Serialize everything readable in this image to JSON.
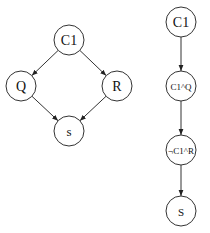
{
  "diagrams": [
    {
      "name": "left-graph",
      "nodes": [
        {
          "id": "C1",
          "label": "C1",
          "x": 69,
          "y": 40,
          "r": 15,
          "font": 14
        },
        {
          "id": "Q",
          "label": "Q",
          "x": 21,
          "y": 86,
          "r": 15,
          "font": 14
        },
        {
          "id": "R",
          "label": "R",
          "x": 117,
          "y": 86,
          "r": 15,
          "font": 14
        },
        {
          "id": "S",
          "label": "s",
          "x": 69,
          "y": 131,
          "r": 15,
          "font": 13
        }
      ],
      "edges": [
        {
          "from": "C1",
          "to": "Q"
        },
        {
          "from": "C1",
          "to": "R"
        },
        {
          "from": "Q",
          "to": "S"
        },
        {
          "from": "R",
          "to": "S"
        }
      ]
    },
    {
      "name": "right-graph",
      "nodes": [
        {
          "id": "C1",
          "label": "C1",
          "x": 181,
          "y": 22,
          "r": 15,
          "font": 14
        },
        {
          "id": "C1Q",
          "label": "C1^Q",
          "x": 181,
          "y": 86,
          "r": 15,
          "font": 9
        },
        {
          "id": "nC1R",
          "label": "¬C1^R",
          "x": 181,
          "y": 150,
          "r": 15,
          "font": 9
        },
        {
          "id": "S",
          "label": "S",
          "x": 181,
          "y": 211,
          "r": 15,
          "font": 11
        }
      ],
      "edges": [
        {
          "from": "C1",
          "to": "C1Q"
        },
        {
          "from": "C1Q",
          "to": "nC1R"
        },
        {
          "from": "nC1R",
          "to": "S"
        }
      ]
    }
  ]
}
